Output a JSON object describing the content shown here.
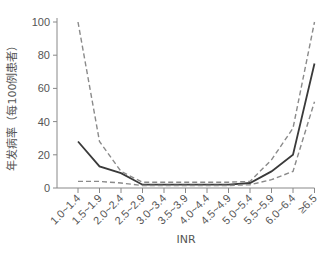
{
  "chart_data": {
    "type": "line",
    "title": "",
    "xlabel": "INR",
    "ylabel": "年发病率（每100例患者）",
    "categories": [
      "1.0~1.4",
      "1.5~1.9",
      "2.0~2.4",
      "2.5~2.9",
      "3.0~3.4",
      "3.5~3.9",
      "4.0~4.4",
      "4.5~4.9",
      "5.0~5.4",
      "5.5~5.9",
      "6.0~6.4",
      "≥6.5"
    ],
    "series": [
      {
        "name": "Incidence",
        "style": "solid",
        "color": "#3a3a3a",
        "values": [
          28,
          13,
          9,
          2,
          2,
          2,
          2,
          2,
          3,
          10,
          20,
          75
        ]
      },
      {
        "name": "Upper CI",
        "style": "dashed",
        "color": "#8a8a8a",
        "values": [
          100,
          28,
          10,
          3.5,
          3.5,
          3.5,
          3.5,
          3.5,
          4,
          17,
          36,
          100
        ]
      },
      {
        "name": "Lower CI",
        "style": "dashed",
        "color": "#8a8a8a",
        "values": [
          4,
          4,
          3,
          1.5,
          1.5,
          1.5,
          1.5,
          1.5,
          2,
          5,
          10,
          52
        ]
      }
    ],
    "yticks": [
      0,
      20,
      40,
      60,
      80,
      100
    ],
    "ylim": [
      0,
      100
    ],
    "grid": false,
    "legend": null
  }
}
